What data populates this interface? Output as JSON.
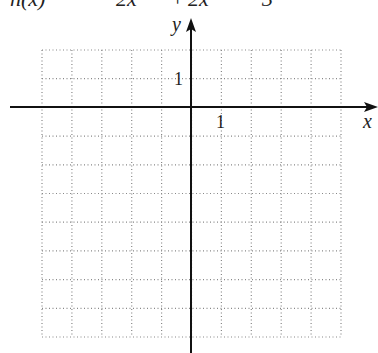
{
  "header": {
    "func_name": "h(x)",
    "term1": "2x",
    "op1": "+",
    "term2": "2x",
    "op2": "−",
    "const": "3"
  },
  "graph": {
    "x_axis_label": "x",
    "y_axis_label": "y",
    "x_tick_label": "1",
    "y_tick_label": "1",
    "grid_columns": 10,
    "grid_rows": 10,
    "x_range": [
      -5,
      5
    ],
    "y_range": [
      -8,
      2
    ],
    "grid_color": "#888888",
    "axis_color": "#111111"
  }
}
